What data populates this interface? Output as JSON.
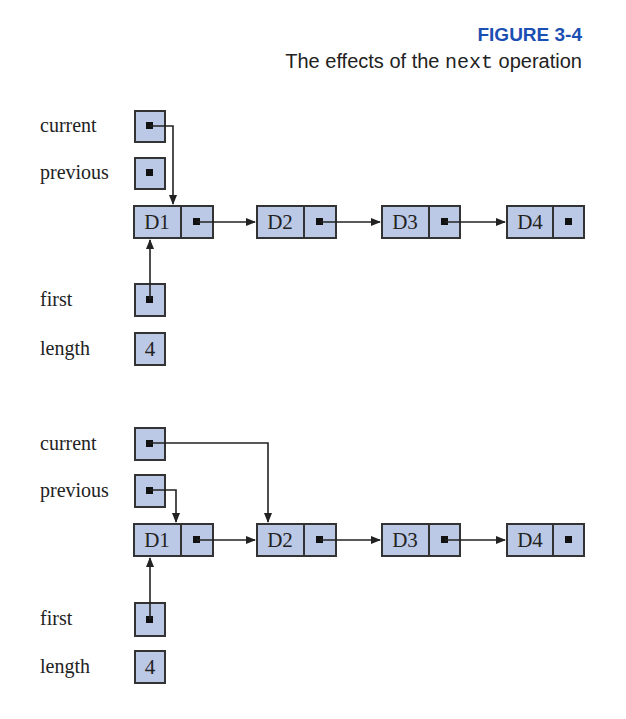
{
  "figure": {
    "label": "FIGURE 3-4",
    "caption_prefix": "The effects of the ",
    "caption_code": "next",
    "caption_suffix": " operation",
    "colors": {
      "label": "#1b4fb3",
      "box_fill": "#bcc9e6",
      "stroke": "#333333"
    }
  },
  "diagrams": [
    {
      "name": "before",
      "variables": {
        "current": "current",
        "previous": "previous",
        "first": "first",
        "length": "length"
      },
      "length_value": "4",
      "nodes": [
        "D1",
        "D2",
        "D3",
        "D4"
      ],
      "current_points_to": "D1",
      "previous_points_to": "null",
      "first_points_to": "D1"
    },
    {
      "name": "after",
      "variables": {
        "current": "current",
        "previous": "previous",
        "first": "first",
        "length": "length"
      },
      "length_value": "4",
      "nodes": [
        "D1",
        "D2",
        "D3",
        "D4"
      ],
      "current_points_to": "D2",
      "previous_points_to": "D1",
      "first_points_to": "D1"
    }
  ]
}
